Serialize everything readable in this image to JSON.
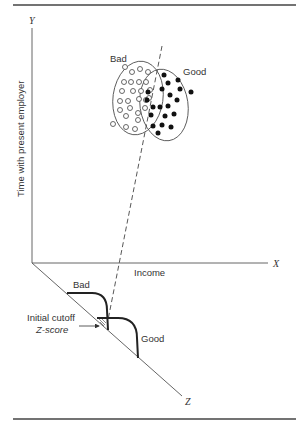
{
  "figure": {
    "y_axis_label": "Time with present employer",
    "y_axis_letter": "Y",
    "x_axis_label": "Income",
    "x_axis_letter": "X",
    "z_axis_letter": "Z",
    "cluster_labels": {
      "bad": "Bad",
      "good": "Good"
    },
    "distribution_labels": {
      "bad": "Bad",
      "good": "Good"
    },
    "cutoff_label_line1": "Initial cutoff",
    "cutoff_label_line2": "Z-score"
  },
  "colors": {
    "ink": "#333333",
    "background": "#ffffff",
    "rule": "#444444"
  },
  "chart_data": {
    "type": "scatter",
    "title": "",
    "xlabel": "Income",
    "ylabel": "Time with present employer",
    "zlabel": "Z",
    "series": [
      {
        "name": "Bad",
        "marker": "open-circle",
        "points": [
          [
            125,
            67
          ],
          [
            132,
            72
          ],
          [
            140,
            69
          ],
          [
            148,
            72
          ],
          [
            124,
            82
          ],
          [
            131,
            82
          ],
          [
            139,
            82
          ],
          [
            146,
            82
          ],
          [
            122,
            91
          ],
          [
            133,
            91
          ],
          [
            141,
            91
          ],
          [
            150,
            90
          ],
          [
            120,
            101
          ],
          [
            128,
            101
          ],
          [
            139,
            99
          ],
          [
            149,
            98
          ],
          [
            120,
            110
          ],
          [
            130,
            108
          ],
          [
            138,
            113
          ],
          [
            113,
            124
          ],
          [
            126,
            116
          ],
          [
            138,
            120
          ],
          [
            126,
            127
          ],
          [
            135,
            129
          ],
          [
            146,
            100
          ],
          [
            145,
            108
          ]
        ]
      },
      {
        "name": "Good",
        "marker": "filled-circle",
        "points": [
          [
            164,
            75
          ],
          [
            178,
            80
          ],
          [
            168,
            83
          ],
          [
            180,
            89
          ],
          [
            148,
            92
          ],
          [
            162,
            89
          ],
          [
            170,
            95
          ],
          [
            191,
            92
          ],
          [
            147,
            100
          ],
          [
            177,
            100
          ],
          [
            153,
            107
          ],
          [
            160,
            107
          ],
          [
            168,
            106
          ],
          [
            151,
            115
          ],
          [
            165,
            116
          ],
          [
            174,
            114
          ],
          [
            153,
            126
          ],
          [
            162,
            125
          ],
          [
            171,
            127
          ],
          [
            158,
            133
          ]
        ]
      }
    ],
    "annotations": [
      "Bad",
      "Good",
      "Initial cutoff Z-score"
    ],
    "legend": null,
    "grid": false
  }
}
